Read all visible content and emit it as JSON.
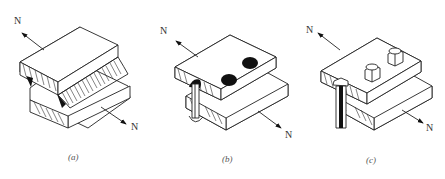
{
  "figure": {
    "panels": [
      {
        "id": "a",
        "caption": "(a)",
        "joint_type": "welded joint",
        "force_label_top": "N",
        "force_label_bottom": "N"
      },
      {
        "id": "b",
        "caption": "(b)",
        "joint_type": "riveted joint",
        "force_label_top": "N",
        "force_label_bottom": "N",
        "fastener_count_visible": 3
      },
      {
        "id": "c",
        "caption": "(c)",
        "joint_type": "bolted joint",
        "force_label_top": "N",
        "force_label_bottom": "N",
        "fastener_count_visible": 3
      }
    ],
    "colors": {
      "line": "#222222",
      "background": "#ffffff",
      "fill_dark": "#111111"
    }
  }
}
